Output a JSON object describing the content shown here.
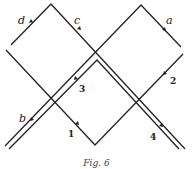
{
  "figure": {
    "caption": "Fig. 6",
    "line_color": "#222222",
    "background": "#ffffff"
  },
  "labels": {
    "a": "a",
    "b": "b",
    "c": "c",
    "d": "d",
    "n1": "1",
    "n2": "2",
    "n3": "3",
    "n4": "4"
  },
  "paths": [
    {
      "id": "d-c",
      "points": [
        [
          11,
          45
        ],
        [
          51,
          4
        ],
        [
          185,
          149
        ]
      ],
      "labels": [
        "d",
        "c"
      ]
    },
    {
      "id": "1-2",
      "points": [
        [
          6,
          50
        ],
        [
          95,
          145
        ],
        [
          183,
          54
        ]
      ],
      "labels": [
        "1",
        "2"
      ]
    },
    {
      "id": "a-b",
      "points": [
        [
          181,
          47
        ],
        [
          141,
          5
        ],
        [
          5,
          146
        ]
      ],
      "labels": [
        "a",
        "b"
      ]
    },
    {
      "id": "3-4",
      "points": [
        [
          9,
          149
        ],
        [
          97,
          60
        ],
        [
          179,
          149
        ]
      ],
      "labels": [
        "3",
        "4"
      ]
    }
  ]
}
